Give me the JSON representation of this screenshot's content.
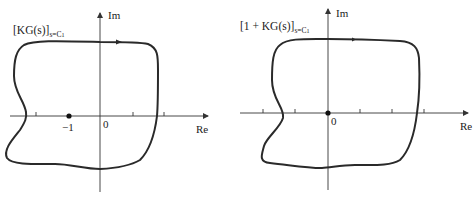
{
  "left_plot": {
    "title_main": "[KG(s)]",
    "title_sub": "s=C",
    "title_sub_index": "1",
    "im_label": "Im",
    "re_label": "Re",
    "origin_label": "0",
    "point_label": "−1"
  },
  "right_plot": {
    "title_main": "[1 + KG(s)]",
    "title_sub": "s=C",
    "title_sub_index": "1",
    "im_label": "Im",
    "re_label": "Re",
    "origin_label": "0"
  },
  "colors": {
    "curve": "#2a2a2a",
    "axis": "#333333",
    "background": "#ffffff"
  }
}
